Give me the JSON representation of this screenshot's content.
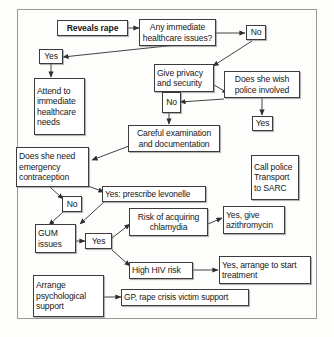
{
  "diagram": {
    "type": "flowchart",
    "frame": {
      "border_color": "#9a9a96",
      "background": "#fdfdfc"
    },
    "node_style": {
      "border_color": "#3b3b3b",
      "fill": "#ffffff",
      "text_color": "#171717"
    },
    "nodes": [
      {
        "id": "reveals",
        "label": "Reveals rape",
        "bold": true,
        "align": "center"
      },
      {
        "id": "any_issues",
        "label": "Any immediate healthcare issues?",
        "bold": false,
        "align": "center"
      },
      {
        "id": "no_issues",
        "label": "No",
        "bold": false,
        "align": "center"
      },
      {
        "id": "yes_issues",
        "label": "Yes",
        "bold": false,
        "align": "center"
      },
      {
        "id": "attend",
        "label": "Attend to immediate healthcare needs",
        "bold": false,
        "align": "left"
      },
      {
        "id": "privacy",
        "label": "Give privacy and security",
        "bold": false,
        "align": "left"
      },
      {
        "id": "police_wish",
        "label": "Does she wish police involved",
        "bold": false,
        "align": "center"
      },
      {
        "id": "police_no",
        "label": "No",
        "bold": false,
        "align": "center"
      },
      {
        "id": "police_yes",
        "label": "Yes",
        "bold": false,
        "align": "center"
      },
      {
        "id": "call_police",
        "label": "Call police Transport to SARC",
        "bold": false,
        "align": "left"
      },
      {
        "id": "careful_exam",
        "label": "Careful examination and documentation",
        "bold": false,
        "align": "center"
      },
      {
        "id": "emergency_contra",
        "label": "Does she need emergency contraception",
        "bold": false,
        "align": "left"
      },
      {
        "id": "levonelle",
        "label": "Yes: prescribe levonelle",
        "bold": false,
        "align": "left"
      },
      {
        "id": "contra_no",
        "label": "No",
        "bold": false,
        "align": "center"
      },
      {
        "id": "gum",
        "label": "GUM issues",
        "bold": false,
        "align": "left"
      },
      {
        "id": "gum_yes",
        "label": "Yes",
        "bold": false,
        "align": "center"
      },
      {
        "id": "chlamydia",
        "label": "Risk of acquiring chlamydia",
        "bold": false,
        "align": "center"
      },
      {
        "id": "azithromycin",
        "label": "Yes, give azithromycin",
        "bold": false,
        "align": "left"
      },
      {
        "id": "hiv",
        "label": "High HIV risk",
        "bold": false,
        "align": "left"
      },
      {
        "id": "hiv_treat",
        "label": "Yes, arrange to start treatment",
        "bold": false,
        "align": "left"
      },
      {
        "id": "psych",
        "label": "Arrange psychological support",
        "bold": false,
        "align": "left"
      },
      {
        "id": "gp_support",
        "label": "GP, rape crisis victim support",
        "bold": false,
        "align": "left"
      }
    ],
    "edges": [
      {
        "from": "reveals",
        "to": "any_issues"
      },
      {
        "from": "any_issues",
        "to": "no_issues"
      },
      {
        "from": "any_issues",
        "to": "yes_issues"
      },
      {
        "from": "yes_issues",
        "to": "attend"
      },
      {
        "from": "no_issues",
        "to": "privacy"
      },
      {
        "from": "privacy",
        "to": "police_wish"
      },
      {
        "from": "police_wish",
        "to": "police_no"
      },
      {
        "from": "police_wish",
        "to": "police_yes"
      },
      {
        "from": "police_no",
        "to": "careful_exam"
      },
      {
        "from": "careful_exam",
        "to": "emergency_contra"
      },
      {
        "from": "emergency_contra",
        "to": "levonelle"
      },
      {
        "from": "emergency_contra",
        "to": "contra_no"
      },
      {
        "from": "contra_no",
        "to": "gum"
      },
      {
        "from": "levonelle",
        "to": "gum"
      },
      {
        "from": "gum",
        "to": "gum_yes"
      },
      {
        "from": "gum_yes",
        "to": "chlamydia"
      },
      {
        "from": "gum_yes",
        "to": "hiv"
      },
      {
        "from": "chlamydia",
        "to": "azithromycin"
      },
      {
        "from": "hiv",
        "to": "hiv_treat"
      },
      {
        "from": "psych",
        "to": "gp_support"
      }
    ]
  }
}
